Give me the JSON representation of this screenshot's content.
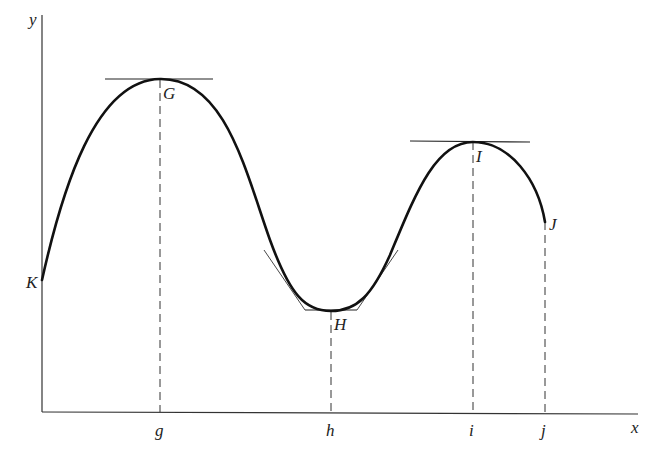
{
  "diagram": {
    "axes": {
      "x_label": "x",
      "y_label": "y"
    },
    "points": [
      {
        "name": "K",
        "label": "K"
      },
      {
        "name": "G",
        "label": "G",
        "foot": "g"
      },
      {
        "name": "H",
        "label": "H",
        "foot": "h"
      },
      {
        "name": "I",
        "label": "I",
        "foot": "i"
      },
      {
        "name": "J",
        "label": "J",
        "foot": "j"
      }
    ],
    "x_ticks": [
      "g",
      "h",
      "i",
      "j"
    ],
    "colors": {
      "curve": "#111111",
      "axis": "#333333",
      "dashed": "#333333"
    }
  }
}
